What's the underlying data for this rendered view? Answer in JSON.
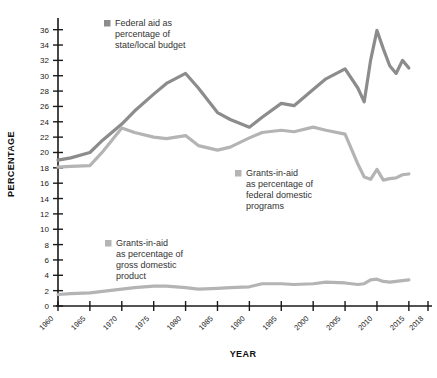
{
  "chart_data": {
    "type": "line",
    "title": "",
    "xlabel": "YEAR",
    "ylabel": "PERCENTAGE",
    "xlim": [
      1960,
      2018
    ],
    "ylim": [
      0,
      37
    ],
    "grid": false,
    "legend_position": "inside-annotations",
    "x_tick_labels": [
      "1960",
      "1965",
      "1970",
      "1975",
      "1980",
      "1985",
      "1990",
      "1995",
      "2000",
      "2005",
      "2010",
      "2015",
      "2018"
    ],
    "y_tick_labels": [
      "0",
      "2",
      "4",
      "6",
      "8",
      "10",
      "12",
      "14",
      "16",
      "18",
      "20",
      "22",
      "24",
      "26",
      "28",
      "30",
      "32",
      "34",
      "36"
    ],
    "x": [
      1960,
      1962,
      1965,
      1967,
      1970,
      1972,
      1975,
      1977,
      1980,
      1982,
      1985,
      1987,
      1990,
      1992,
      1995,
      1997,
      2000,
      2002,
      2005,
      2007,
      2008,
      2009,
      2010,
      2011,
      2012,
      2013,
      2014,
      2015
    ],
    "series": [
      {
        "name": "Federal aid as percentage of state/local budget",
        "color": "#8c8c8c",
        "values": [
          19.0,
          19.3,
          20.0,
          21.6,
          23.7,
          25.4,
          27.6,
          29.0,
          30.3,
          28.4,
          25.2,
          24.3,
          23.3,
          24.6,
          26.4,
          26.1,
          28.2,
          29.6,
          30.9,
          28.4,
          26.6,
          32.0,
          35.9,
          33.5,
          31.3,
          30.3,
          32.0,
          31.0
        ]
      },
      {
        "name": "Grants-in-aid as percentage of federal domestic programs",
        "color": "#b4b4b4",
        "values": [
          18.1,
          18.2,
          18.3,
          20.1,
          23.2,
          22.6,
          22.0,
          21.8,
          22.2,
          20.9,
          20.3,
          20.7,
          21.9,
          22.6,
          22.9,
          22.7,
          23.3,
          22.9,
          22.4,
          18.5,
          16.8,
          16.5,
          17.8,
          16.4,
          16.6,
          16.7,
          17.1,
          17.2
        ]
      },
      {
        "name": "Grants-in-aid as percentage of gross domestic product",
        "color": "#b4b4b4",
        "values": [
          1.5,
          1.6,
          1.7,
          1.9,
          2.2,
          2.4,
          2.6,
          2.6,
          2.4,
          2.2,
          2.3,
          2.4,
          2.5,
          2.9,
          2.9,
          2.8,
          2.9,
          3.1,
          3.0,
          2.8,
          2.9,
          3.4,
          3.5,
          3.2,
          3.1,
          3.2,
          3.3,
          3.4
        ]
      }
    ],
    "annotations": [
      {
        "name": "federal-aid-state-local",
        "lines": [
          "Federal aid as",
          "percentage of",
          "state/local budget"
        ],
        "swatch_color": "#8c8c8c",
        "x": 104,
        "y": 26
      },
      {
        "name": "grants-federal-domestic",
        "lines": [
          "Grants-in-aid",
          "as percentage of",
          "federal domestic",
          "programs"
        ],
        "swatch_color": "#b4b4b4",
        "x": 235,
        "y": 176
      },
      {
        "name": "grants-gdp",
        "lines": [
          "Grants-in-aid",
          "as percentage of",
          "gross domestic",
          "product"
        ],
        "swatch_color": "#b4b4b4",
        "x": 105,
        "y": 246
      }
    ]
  }
}
